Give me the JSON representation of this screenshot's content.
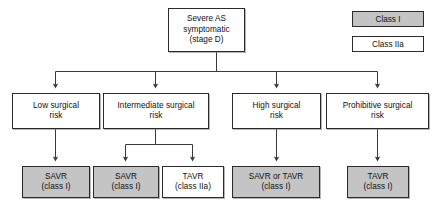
{
  "diagram": {
    "title_node": {
      "lines": [
        "Severe AS",
        "symptomatic",
        "(stage D)"
      ],
      "fill": "#ffffff"
    },
    "risk_nodes": [
      {
        "lines": [
          "Low surgical",
          "risk"
        ],
        "fill": "#ffffff"
      },
      {
        "lines": [
          "Intermediate surgical",
          "risk"
        ],
        "fill": "#ffffff"
      },
      {
        "lines": [
          "High surgical",
          "risk"
        ],
        "fill": "#ffffff"
      },
      {
        "lines": [
          "Prohibitive surgical",
          "risk"
        ],
        "fill": "#ffffff"
      }
    ],
    "treatment_nodes": [
      {
        "lines": [
          "SAVR",
          "(class I)"
        ],
        "fill": "#c4c4c4",
        "class_level": "Class I"
      },
      {
        "lines": [
          "SAVR",
          "(class I)"
        ],
        "fill": "#c4c4c4",
        "class_level": "Class I"
      },
      {
        "lines": [
          "TAVR",
          "(class IIa)"
        ],
        "fill": "#ffffff",
        "class_level": "Class IIa"
      },
      {
        "lines": [
          "SAVR or TAVR",
          "(class I)"
        ],
        "fill": "#c4c4c4",
        "class_level": "Class I"
      },
      {
        "lines": [
          "TAVR",
          "(class I)"
        ],
        "fill": "#c4c4c4",
        "class_level": "Class I"
      }
    ],
    "legend": [
      {
        "label": "Class I",
        "fill": "#c4c4c4"
      },
      {
        "label": "Class IIa",
        "fill": "#ffffff"
      }
    ],
    "colors": {
      "class_i_fill": "#c4c4c4",
      "class_iia_fill": "#ffffff",
      "border": "#2b2b2b",
      "connector": "#3a3a3a",
      "background": "#ffffff"
    }
  }
}
